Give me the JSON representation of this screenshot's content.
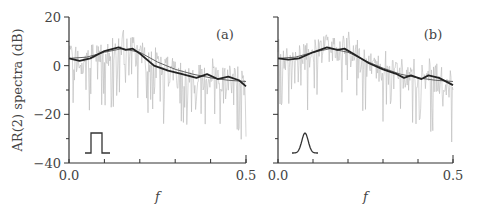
{
  "figure": {
    "ylabel": "AR(2) spectra  (dB)",
    "xlabel": "f"
  },
  "chart_data": [
    {
      "type": "line",
      "panel": "(a)",
      "title": "",
      "xlabel": "f",
      "ylabel": "AR(2) spectra (dB)",
      "xlim": [
        0.0,
        0.5
      ],
      "ylim": [
        -40,
        20
      ],
      "xticks": [
        0.0,
        0.1,
        0.2,
        0.3,
        0.4,
        0.5
      ],
      "xtick_labels": [
        "0.0",
        "",
        "",
        "",
        "",
        "0.5"
      ],
      "yticks": [
        -40,
        -30,
        -20,
        -10,
        0,
        10,
        20
      ],
      "ytick_labels": [
        "−40",
        "",
        "−20",
        "",
        "0",
        "",
        "20"
      ],
      "grid": false,
      "inset_shape": "rectangular pulse",
      "series": [
        {
          "name": "periodogram (noisy, gray)",
          "style": "gray thin",
          "x": [
            0.0,
            0.5
          ],
          "range_db": [
            -30,
            14
          ]
        },
        {
          "name": "smoothed estimate (thick)",
          "x": [
            0.0,
            0.03,
            0.06,
            0.1,
            0.14,
            0.16,
            0.18,
            0.2,
            0.24,
            0.28,
            0.32,
            0.36,
            0.39,
            0.42,
            0.45,
            0.48,
            0.5
          ],
          "y": [
            3,
            2,
            3,
            6,
            7.5,
            6.5,
            7,
            5,
            0,
            -2,
            -3.5,
            -5,
            -3.5,
            -5.5,
            -4.5,
            -6,
            -8.5
          ]
        },
        {
          "name": "AR(2) fit (thin)",
          "x": [
            0.0,
            0.05,
            0.1,
            0.15,
            0.2,
            0.25,
            0.3,
            0.35,
            0.4,
            0.45,
            0.5
          ],
          "y": [
            3,
            3.5,
            5.5,
            7,
            5.5,
            1.5,
            -1.5,
            -3.5,
            -5,
            -6,
            -6.5
          ]
        }
      ]
    },
    {
      "type": "line",
      "panel": "(b)",
      "title": "",
      "xlabel": "f",
      "ylabel": "",
      "xlim": [
        0.0,
        0.5
      ],
      "ylim": [
        -40,
        20
      ],
      "xticks": [
        0.0,
        0.1,
        0.2,
        0.3,
        0.4,
        0.5
      ],
      "xtick_labels": [
        "0.0",
        "",
        "",
        "",
        "",
        "0.5"
      ],
      "yticks": [
        -40,
        -30,
        -20,
        -10,
        0,
        10,
        20
      ],
      "ytick_labels": [
        "",
        "",
        "",
        "",
        "",
        "",
        ""
      ],
      "grid": false,
      "inset_shape": "gaussian pulse",
      "series": [
        {
          "name": "periodogram (noisy, gray)",
          "style": "gray thin",
          "x": [
            0.0,
            0.5
          ],
          "range_db": [
            -35,
            14
          ]
        },
        {
          "name": "smoothed estimate (thick)",
          "x": [
            0.0,
            0.03,
            0.06,
            0.1,
            0.14,
            0.17,
            0.19,
            0.22,
            0.26,
            0.3,
            0.34,
            0.36,
            0.38,
            0.41,
            0.43,
            0.46,
            0.5
          ],
          "y": [
            3,
            2.5,
            3,
            5.5,
            7.5,
            6.5,
            7,
            4.5,
            1,
            -1.5,
            -3.5,
            -5,
            -4,
            -5.5,
            -4,
            -5,
            -8
          ]
        },
        {
          "name": "AR(2) fit (thin)",
          "x": [
            0.0,
            0.05,
            0.1,
            0.15,
            0.2,
            0.25,
            0.3,
            0.35,
            0.4,
            0.45,
            0.5
          ],
          "y": [
            3,
            3.5,
            5.5,
            7,
            5.5,
            2,
            -1,
            -3.5,
            -5,
            -6,
            -6.5
          ]
        }
      ]
    }
  ]
}
